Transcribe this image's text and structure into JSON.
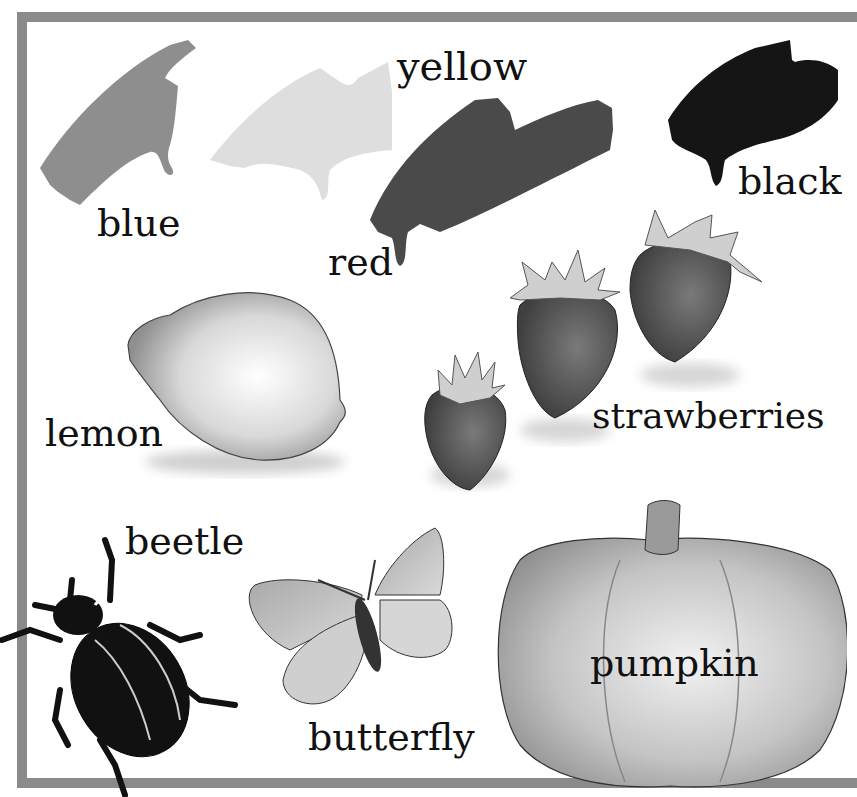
{
  "page": {
    "labels": {
      "blue": "blue",
      "yellow": "yellow",
      "red": "red",
      "black": "black",
      "lemon": "lemon",
      "strawberries": "strawberries",
      "beetle": "beetle",
      "butterfly": "butterfly",
      "pumpkin": "pumpkin"
    },
    "colors": {
      "frame": "#8a8a8a",
      "blue_paint": "#8e8e8e",
      "yellow_paint": "#dcdcdc",
      "red_paint": "#4a4a4a",
      "black_paint": "#151515",
      "text": "#111111"
    }
  }
}
